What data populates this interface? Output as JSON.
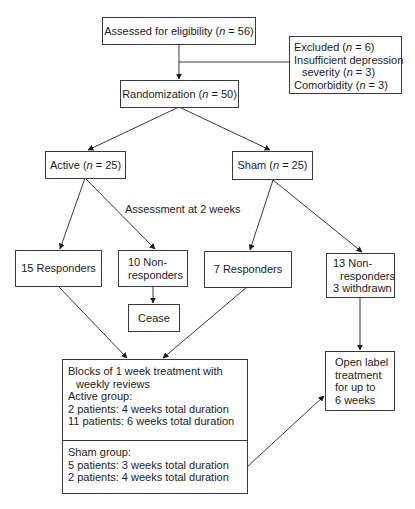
{
  "diagram": {
    "type": "flowchart",
    "nodes": {
      "assessed": {
        "pre": "Assessed for eligibility (",
        "n": "n",
        "post": " = 56)"
      },
      "excluded": {
        "line1_pre": "Excluded (",
        "line1_n": "n",
        "line1_post": " = 6)",
        "line2": "Insufficient depression",
        "line3_pre": "severity (",
        "line3_n": "n",
        "line3_post": " = 3)",
        "line4_pre": "Comorbidity (",
        "line4_n": "n",
        "line4_post": " = 3)"
      },
      "randomization": {
        "pre": "Randomization (",
        "n": "n",
        "post": " = 50)"
      },
      "active": {
        "pre": "Active (",
        "n": "n",
        "post": " = 25)"
      },
      "sham": {
        "pre": "Sham (",
        "n": "n",
        "post": " = 25)"
      },
      "active_responders": {
        "label": "15 Responders"
      },
      "active_nonresponders": {
        "line1": "10 Non-",
        "line2": "responders"
      },
      "sham_responders": {
        "label": "7 Responders"
      },
      "sham_nonresponders": {
        "line1": "13 Non-",
        "line2": "responders",
        "line3": "3 withdrawn"
      },
      "cease": {
        "label": "Cease"
      },
      "blocks": {
        "top": {
          "line1": "Blocks of 1 week treatment with",
          "line2": "weekly reviews",
          "line3": "Active group:",
          "line4": "2 patients: 4 weeks total duration",
          "line5": "11 patients: 6 weeks total duration"
        },
        "bottom": {
          "line1": "Sham group:",
          "line2": "5 patients: 3 weeks total duration",
          "line3": "2 patients: 4 weeks total duration"
        }
      },
      "open_label": {
        "line1": "Open label",
        "line2": "treatment",
        "line3": "for up to",
        "line4": "6 weeks"
      }
    },
    "annotations": {
      "assessment_label": "Assessment at 2 weeks"
    },
    "edges": [
      {
        "from": "assessed",
        "to": "randomization"
      },
      {
        "from": "assessed",
        "to": "excluded",
        "style": "branch-line"
      },
      {
        "from": "randomization",
        "to": "active"
      },
      {
        "from": "randomization",
        "to": "sham"
      },
      {
        "from": "active",
        "to": "active_responders"
      },
      {
        "from": "active",
        "to": "active_nonresponders"
      },
      {
        "from": "sham",
        "to": "sham_responders"
      },
      {
        "from": "sham",
        "to": "sham_nonresponders"
      },
      {
        "from": "active_nonresponders",
        "to": "cease"
      },
      {
        "from": "active_responders",
        "to": "blocks"
      },
      {
        "from": "sham_responders",
        "to": "blocks"
      },
      {
        "from": "sham_nonresponders",
        "to": "open_label"
      },
      {
        "from": "blocks",
        "to": "open_label"
      }
    ],
    "colors": {
      "stroke": "#3a3a3a",
      "text": "#1c1c1c",
      "background": "#ffffff"
    }
  }
}
